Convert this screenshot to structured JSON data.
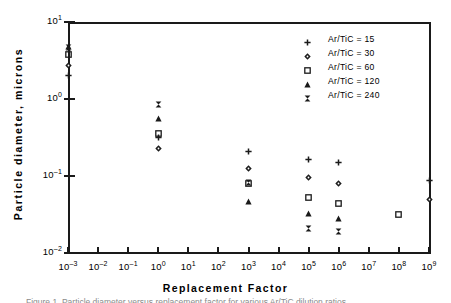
{
  "figure": {
    "caption_partial": "Figure 1. Particle diameter versus replacement factor for various Ar/TiC dilution ratios"
  },
  "axes": {
    "x_title": "Replacement  Factor",
    "y_title": "Particle  diameter,  microns",
    "x_ticks": [
      {
        "exp": "-3",
        "base": "10"
      },
      {
        "exp": "-2",
        "base": "10"
      },
      {
        "exp": "-1",
        "base": "10"
      },
      {
        "exp": "0",
        "base": "10"
      },
      {
        "exp": "1",
        "base": "10"
      },
      {
        "exp": "2",
        "base": "10"
      },
      {
        "exp": "3",
        "base": "10"
      },
      {
        "exp": "4",
        "base": "10"
      },
      {
        "exp": "5",
        "base": "10"
      },
      {
        "exp": "6",
        "base": "10"
      },
      {
        "exp": "7",
        "base": "10"
      },
      {
        "exp": "8",
        "base": "10"
      },
      {
        "exp": "9",
        "base": "10"
      }
    ],
    "y_ticks": [
      {
        "exp": "1",
        "base": "10"
      },
      {
        "exp": "0",
        "base": "10"
      },
      {
        "exp": "-1",
        "base": "10"
      },
      {
        "exp": "-2",
        "base": "10"
      }
    ]
  },
  "legend": {
    "entries": [
      {
        "label": "Ar/TiC = 15",
        "marker": "plus-marker"
      },
      {
        "label": "Ar/TiC = 30",
        "marker": "diamond-marker"
      },
      {
        "label": "Ar/TiC = 60",
        "marker": "square-marker"
      },
      {
        "label": "Ar/TiC = 120",
        "marker": "triangle-marker"
      },
      {
        "label": "Ar/TiC = 240",
        "marker": "bowtie-marker"
      }
    ]
  },
  "chart_data": {
    "type": "scatter",
    "title": "",
    "xlabel": "Replacement Factor",
    "ylabel": "Particle diameter, microns",
    "xscale": "log",
    "yscale": "log",
    "xlim": [
      0.001,
      1000000000
    ],
    "ylim": [
      0.01,
      10
    ],
    "grid": false,
    "legend_position": "top-right",
    "series": [
      {
        "name": "Ar/TiC = 15",
        "marker": "plus",
        "points": [
          {
            "x": 0.001,
            "y": 2.0
          },
          {
            "x": 1,
            "y": 0.32
          },
          {
            "x": 1000,
            "y": 0.21
          },
          {
            "x": 100000,
            "y": 0.165
          },
          {
            "x": 1000000,
            "y": 0.15
          },
          {
            "x": 1000000000,
            "y": 0.088
          }
        ]
      },
      {
        "name": "Ar/TiC = 30",
        "marker": "diamond",
        "points": [
          {
            "x": 0.001,
            "y": 2.7
          },
          {
            "x": 1,
            "y": 0.23
          },
          {
            "x": 1000,
            "y": 0.125
          },
          {
            "x": 100000,
            "y": 0.095
          },
          {
            "x": 1000000,
            "y": 0.08
          },
          {
            "x": 1000000000,
            "y": 0.049
          }
        ]
      },
      {
        "name": "Ar/TiC = 60",
        "marker": "square",
        "points": [
          {
            "x": 0.001,
            "y": 3.8
          },
          {
            "x": 1,
            "y": 0.36
          },
          {
            "x": 1000,
            "y": 0.079
          },
          {
            "x": 100000,
            "y": 0.053
          },
          {
            "x": 1000000,
            "y": 0.044
          },
          {
            "x": 100000000,
            "y": 0.032
          }
        ]
      },
      {
        "name": "Ar/TiC = 120",
        "marker": "triangle",
        "points": [
          {
            "x": 0.001,
            "y": 4.8
          },
          {
            "x": 1,
            "y": 0.55
          },
          {
            "x": 1000,
            "y": 0.047
          },
          {
            "x": 100000,
            "y": 0.033
          },
          {
            "x": 1000000,
            "y": 0.028
          }
        ]
      },
      {
        "name": "Ar/TiC = 240",
        "marker": "bowtie",
        "points": [
          {
            "x": 0.001,
            "y": 4.6
          },
          {
            "x": 1,
            "y": 0.85
          },
          {
            "x": 1000,
            "y": 0.083
          },
          {
            "x": 100000,
            "y": 0.021
          },
          {
            "x": 1000000,
            "y": 0.019
          }
        ]
      }
    ]
  },
  "colors": {
    "ink": "#1a1a1a",
    "background": "#ffffff"
  }
}
